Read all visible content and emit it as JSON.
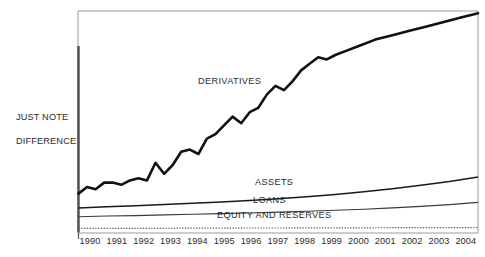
{
  "chart_data": {
    "type": "line",
    "title": "",
    "subtitle": "",
    "xlabel": "",
    "ylabel": "JUST NOTE\nDIFFERENCE",
    "grid": false,
    "legend_position": "inline-annotations",
    "axis_note": "Vertical axis is unlabeled and unscaled; values are relative index units read off the plot.",
    "categories": [
      "1990",
      "1991",
      "1992",
      "1993",
      "1994",
      "1995",
      "1996",
      "1997",
      "1998",
      "1999",
      "2000",
      "2001",
      "2002",
      "2003",
      "2004"
    ],
    "x": [
      1990,
      1991,
      1992,
      1993,
      1994,
      1995,
      1996,
      1997,
      1998,
      1999,
      2000,
      2001,
      2002,
      2003,
      2004
    ],
    "xlim": [
      1990,
      2004
    ],
    "ylim": [
      0,
      100
    ],
    "series": [
      {
        "name": "DERIVATIVES",
        "values": [
          17,
          21,
          23,
          31,
          41,
          52,
          56,
          68,
          78,
          84,
          88,
          91,
          94,
          96,
          99
        ],
        "detail_x": [
          1990.0,
          1990.3,
          1990.6,
          1990.9,
          1991.2,
          1991.5,
          1991.8,
          1992.1,
          1992.4,
          1992.7,
          1993.0,
          1993.3,
          1993.6,
          1993.9,
          1994.2,
          1994.5,
          1994.8,
          1995.1,
          1995.4,
          1995.7,
          1996.0,
          1996.3,
          1996.6,
          1996.9,
          1997.2,
          1997.5,
          1997.8,
          1998.1,
          1998.4,
          1998.7,
          1999.0,
          1999.4,
          1999.8,
          2000.4,
          2001.0,
          2001.6,
          2002.2,
          2002.8,
          2003.4,
          2004.0
        ],
        "detail_values": [
          17,
          20,
          19,
          22,
          22,
          21,
          23,
          24,
          23,
          31,
          26,
          30,
          36,
          37,
          35,
          42,
          44,
          48,
          52,
          49,
          54,
          56,
          62,
          66,
          64,
          68,
          73,
          76,
          79,
          78,
          80,
          82,
          84,
          87,
          89,
          91,
          93,
          95,
          97,
          99
        ],
        "line_width": 2.6,
        "color": "#111111"
      },
      {
        "name": "ASSETS",
        "values": [
          10.5,
          11.0,
          11.5,
          12.0,
          12.6,
          13.2,
          13.9,
          14.7,
          15.6,
          16.6,
          17.8,
          19.2,
          20.8,
          22.5,
          24.5
        ],
        "line_width": 1.5,
        "color": "#1a1a1a"
      },
      {
        "name": "LOANS",
        "values": [
          6.5,
          6.8,
          7.0,
          7.3,
          7.6,
          7.9,
          8.2,
          8.6,
          9.0,
          9.4,
          9.9,
          10.5,
          11.2,
          12.0,
          13.0
        ],
        "line_width": 1.1,
        "color": "#3a3a3a"
      },
      {
        "name": "EQUITY AND RESERVES",
        "values": [
          1.2,
          1.2,
          1.25,
          1.25,
          1.3,
          1.3,
          1.35,
          1.35,
          1.4,
          1.4,
          1.45,
          1.5,
          1.5,
          1.55,
          1.6
        ],
        "line_style": "dotted",
        "line_width": 1.2,
        "color": "#555555"
      }
    ],
    "annotations": [
      {
        "text": "DERIVATIVES",
        "x": 1993.4,
        "y": 58
      },
      {
        "text": "ASSETS",
        "x": 1995.8,
        "y": 14
      },
      {
        "text": "LOANS",
        "x": 1995.7,
        "y": 8
      },
      {
        "text": "EQUITY AND RESERVES",
        "x": 1994.4,
        "y": 3
      }
    ]
  },
  "axis": {
    "y_title_line1": "JUST NOTE",
    "y_title_line2": "DIFFERENCE",
    "y_title": "JUST NOTE\nDIFFERENCE"
  },
  "labels": {
    "derivatives": "DERIVATIVES",
    "assets": "ASSETS",
    "loans": "LOANS",
    "equity": "EQUITY AND RESERVES"
  },
  "ticks": [
    "1990",
    "1991",
    "1992",
    "1993",
    "1994",
    "1995",
    "1996",
    "1997",
    "1998",
    "1999",
    "2000",
    "2001",
    "2002",
    "2003",
    "2004"
  ],
  "colors": {
    "background": "#ffffff",
    "frame": "#9a9a9a",
    "axis": "#4d4d4d",
    "derivatives": "#111111",
    "assets": "#1a1a1a",
    "loans": "#3a3a3a",
    "equity": "#555555",
    "text": "#2b2b2b"
  }
}
